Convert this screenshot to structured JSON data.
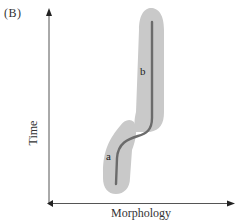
{
  "figure": {
    "panel_label": "(B)",
    "x_axis_label": "Morphology",
    "y_axis_label": "Time",
    "segments": [
      {
        "id": "a",
        "label": "a"
      },
      {
        "id": "b",
        "label": "b"
      }
    ],
    "colors": {
      "axis": "#555555",
      "envelope": "#c8c8c8",
      "trajectory": "#6e6e6e",
      "text": "#333333"
    }
  }
}
